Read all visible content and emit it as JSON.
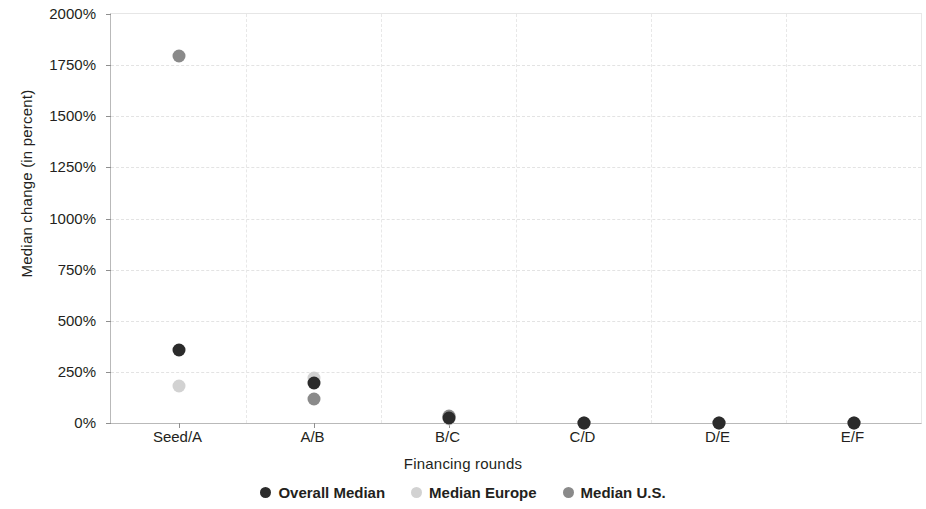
{
  "chart_data": {
    "type": "scatter",
    "title": "",
    "xlabel": "Financing rounds",
    "ylabel": "Median change (in percent)",
    "categories": [
      "Seed/A",
      "A/B",
      "B/C",
      "C/D",
      "D/E",
      "E/F"
    ],
    "ylim": [
      0,
      2000
    ],
    "ytick_labels": [
      "0%",
      "250%",
      "500%",
      "750%",
      "1000%",
      "1250%",
      "1500%",
      "1750%",
      "2000%"
    ],
    "ytick_values": [
      0,
      250,
      500,
      750,
      1000,
      1250,
      1500,
      1750,
      2000
    ],
    "grid": true,
    "legend_position": "bottom",
    "series": [
      {
        "name": "Overall Median",
        "color": "#2b2b2b",
        "values": [
          357,
          196,
          25,
          0,
          0,
          0
        ]
      },
      {
        "name": "Median Europe",
        "color": "#d2d2d2",
        "values": [
          181,
          220,
          20,
          0,
          0,
          0
        ]
      },
      {
        "name": "Median U.S.",
        "color": "#8a8a8a",
        "values": [
          1795,
          118,
          35,
          0,
          0,
          0
        ]
      }
    ]
  },
  "legend": {
    "items": [
      {
        "label": "Overall Median",
        "color": "#2b2b2b"
      },
      {
        "label": "Median Europe",
        "color": "#d2d2d2"
      },
      {
        "label": "Median U.S.",
        "color": "#8a8a8a"
      }
    ]
  }
}
